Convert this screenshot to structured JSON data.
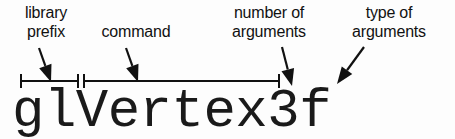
{
  "figure": {
    "background_color": "#fdfdfd",
    "ink_color": "#111111",
    "code_color": "#1a1a1a"
  },
  "code": {
    "token": "glVertex3f"
  },
  "labels": {
    "library_prefix": {
      "line1": "library",
      "line2": "prefix"
    },
    "command": {
      "line1": "command"
    },
    "number_of_arguments": {
      "line1": "number of",
      "line2": "arguments"
    },
    "type_of_arguments": {
      "line1": "type of",
      "line2": "arguments"
    }
  },
  "brackets": [
    {
      "name": "library-prefix-span",
      "covers": "gl",
      "x_start": 21,
      "x_end": 78,
      "y": 81
    },
    {
      "name": "command-span",
      "covers": "Vertex",
      "x_start": 84,
      "x_end": 279,
      "y": 81
    }
  ],
  "arrows": [
    {
      "name": "arrow-to-library-prefix",
      "from_x": 39,
      "from_y": 48,
      "to_x": 51,
      "to_y": 82,
      "direction": "down-right"
    },
    {
      "name": "arrow-to-command",
      "from_x": 126,
      "from_y": 48,
      "to_x": 138,
      "to_y": 82,
      "direction": "down-right"
    },
    {
      "name": "arrow-to-number-of-arguments",
      "from_x": 282,
      "from_y": 47,
      "to_x": 292,
      "to_y": 86,
      "direction": "down-right"
    },
    {
      "name": "arrow-to-type-of-arguments",
      "from_x": 364,
      "from_y": 47,
      "to_x": 337,
      "to_y": 84,
      "direction": "down-left"
    }
  ]
}
